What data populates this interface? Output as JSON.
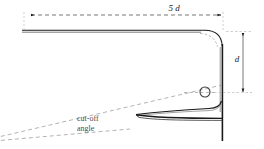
{
  "diagram": {
    "colors": {
      "outline": "#1a1a1a",
      "dashed": "#8c8c8c",
      "label": "#1a1a1a",
      "annotation": "#4d4d4d",
      "background": "#ffffff"
    },
    "labels": {
      "horizontal_dimension": "5 d",
      "vertical_dimension": "d",
      "cutoff_line1": "cut-off",
      "cutoff_line2": "angle"
    },
    "geometry": {
      "ceiling_y": 31,
      "ceiling_x_start": 22,
      "wall_x": 223,
      "wall_y_top": 31,
      "wall_y_bottom": 141,
      "lamp_center_x": 205,
      "lamp_center_y": 92,
      "lamp_radius": 5,
      "horizontal_dim_y": 15,
      "horizontal_dim_x_start": 30,
      "horizontal_dim_x_end": 222,
      "vertical_dim_x": 243,
      "vertical_dim_y_top": 32,
      "vertical_dim_y_bottom": 93
    }
  }
}
